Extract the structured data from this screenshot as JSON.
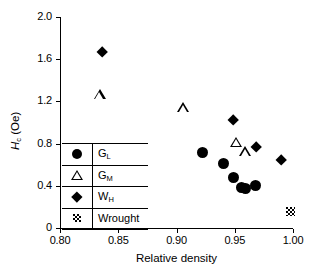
{
  "chart_data": {
    "type": "scatter",
    "title": "",
    "xlabel": "Relative density",
    "ylabel": "Hc (Oe)",
    "ylabel_main": "H",
    "ylabel_sub": "c",
    "ylabel_unit": " (Oe)",
    "xlim": [
      0.8,
      1.0
    ],
    "ylim": [
      0,
      2.0
    ],
    "xticks": [
      "0.80",
      "0.85",
      "0.90",
      "0.95",
      "1.00"
    ],
    "xtick_values": [
      0.8,
      0.85,
      0.9,
      0.95,
      1.0
    ],
    "yticks": [
      "0",
      "0.4",
      "0.8",
      "1.2",
      "1.6",
      "2.0"
    ],
    "ytick_values": [
      0,
      0.4,
      0.8,
      1.2,
      1.6,
      2.0
    ],
    "grid": false,
    "legend_position": "lower-left-inside",
    "series": [
      {
        "name": "GL",
        "label_main": "G",
        "label_sub": "L",
        "marker": "filled-circle",
        "points": [
          {
            "x": 0.922,
            "y": 0.72
          },
          {
            "x": 0.94,
            "y": 0.61
          },
          {
            "x": 0.949,
            "y": 0.48
          },
          {
            "x": 0.956,
            "y": 0.385
          },
          {
            "x": 0.959,
            "y": 0.375
          },
          {
            "x": 0.968,
            "y": 0.4
          }
        ]
      },
      {
        "name": "GM",
        "label_main": "G",
        "label_sub": "M",
        "marker": "open-triangle",
        "points": [
          {
            "x": 0.834,
            "y": 1.26
          },
          {
            "x": 0.906,
            "y": 1.14
          },
          {
            "x": 0.951,
            "y": 0.81
          },
          {
            "x": 0.959,
            "y": 0.72
          }
        ]
      },
      {
        "name": "WH",
        "label_main": "W",
        "label_sub": "H",
        "marker": "filled-diamond",
        "points": [
          {
            "x": 0.836,
            "y": 1.67
          },
          {
            "x": 0.949,
            "y": 1.02
          },
          {
            "x": 0.968,
            "y": 0.77
          },
          {
            "x": 0.99,
            "y": 0.64
          }
        ]
      },
      {
        "name": "Wrought",
        "label_main": "Wrought",
        "label_sub": "",
        "marker": "hatched-square",
        "points": [
          {
            "x": 0.998,
            "y": 0.155
          }
        ]
      }
    ]
  }
}
